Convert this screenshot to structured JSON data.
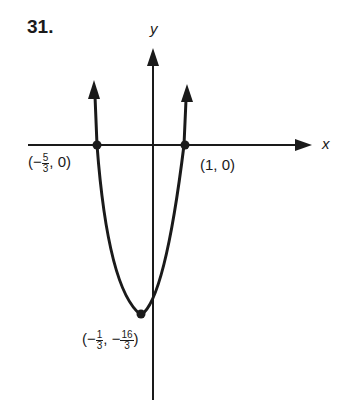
{
  "problem_number": "31.",
  "axes": {
    "x_label": "x",
    "y_label": "y"
  },
  "points": {
    "left_intercept": {
      "open": "(−",
      "num": "5",
      "den": "3",
      "close": ", 0)"
    },
    "right_intercept": {
      "text": "(1, 0)"
    },
    "vertex": {
      "open": "(−",
      "num1": "1",
      "den1": "3",
      "mid": ", −",
      "num2": "16",
      "den2": "3",
      "close": ")"
    }
  },
  "curve": {
    "type": "parabola",
    "opens": "up",
    "x_intercepts": [
      "-5/3",
      "1"
    ],
    "vertex": [
      "-1/3",
      "-16/3"
    ]
  }
}
